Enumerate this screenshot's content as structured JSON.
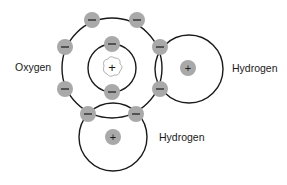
{
  "diagram": {
    "labels": {
      "oxygen": "Oxygen",
      "hydrogen_right": "Hydrogen",
      "hydrogen_bottom": "Hydrogen"
    },
    "symbols": {
      "electron": "−",
      "proton": "+"
    },
    "colors": {
      "shell_stroke": "#1a1a1a",
      "electron_fill": "#a9a9a9",
      "nucleus_fill": "#a9a9a9",
      "background": "#ffffff"
    }
  }
}
